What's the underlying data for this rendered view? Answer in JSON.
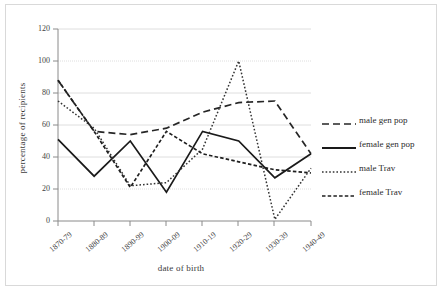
{
  "chart_data": {
    "type": "line",
    "title": "",
    "xlabel": "date of birth",
    "ylabel": "percentage of recipients",
    "categories": [
      "1870-79",
      "1880-89",
      "1890-99",
      "1900-09",
      "1910-19",
      "1920-29",
      "1930-39",
      "1940-49"
    ],
    "ylim": [
      0,
      120
    ],
    "yticks": [
      0,
      20,
      40,
      60,
      80,
      100,
      120
    ],
    "grid": true,
    "legend_position": "right",
    "series": [
      {
        "name": "male gen pop",
        "style": "long-dash",
        "color": "#262626",
        "values": [
          88,
          56,
          54,
          58,
          68,
          74,
          75,
          42
        ]
      },
      {
        "name": "female gen pop",
        "style": "solid",
        "color": "#1a1a1a",
        "values": [
          51,
          28,
          50,
          18,
          56,
          50,
          27,
          42
        ]
      },
      {
        "name": "male Trav",
        "style": "dotted",
        "color": "#333333",
        "values": [
          75,
          58,
          22,
          24,
          45,
          100,
          1,
          33
        ]
      },
      {
        "name": "female Trav",
        "style": "short-dash",
        "color": "#1f1f1f",
        "values": [
          88,
          56,
          21,
          56,
          42,
          37,
          32,
          30
        ]
      }
    ]
  },
  "axes": {
    "y_title": "percentage of recipients",
    "x_title": "date of birth",
    "y_tick_labels": [
      "120",
      "100",
      "80",
      "60",
      "40",
      "20",
      "0"
    ],
    "x_tick_labels": [
      "1870-79",
      "1880-89",
      "1890-99",
      "1900-09",
      "1910-19",
      "1920-29",
      "1930-39",
      "1940-49"
    ]
  },
  "legend": {
    "items": [
      {
        "label": "male gen pop"
      },
      {
        "label": "female gen pop"
      },
      {
        "label": "male Trav"
      },
      {
        "label": "female Trav"
      }
    ]
  },
  "colors": {
    "frame_border": "#d9d9d9",
    "gridline": "#d6d6d6",
    "axis_line": "#7f7f7f",
    "line_default": "#222222"
  }
}
